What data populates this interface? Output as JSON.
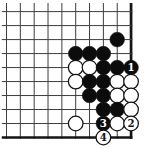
{
  "diagram": {
    "type": "go-problem-diagram",
    "board": {
      "visible_cols": 10,
      "visible_rows": 10,
      "edges": {
        "top": false,
        "left": false,
        "right": true,
        "bottom": true
      },
      "colors": {
        "background": "#ffffff",
        "grid_line": "#3d3d3d",
        "edge_line": "#151515",
        "black_stone": "#0c0c0c",
        "white_stone": "#ffffff",
        "stone_outline": "#151515",
        "label_on_black": "#ffffff",
        "label_on_white": "#151515"
      }
    },
    "stones": [
      {
        "col": 8,
        "row": 2,
        "color": "black",
        "label": ""
      },
      {
        "col": 5,
        "row": 3,
        "color": "black",
        "label": ""
      },
      {
        "col": 6,
        "row": 3,
        "color": "black",
        "label": ""
      },
      {
        "col": 7,
        "row": 3,
        "color": "black",
        "label": ""
      },
      {
        "col": 5,
        "row": 4,
        "color": "white",
        "label": ""
      },
      {
        "col": 6,
        "row": 4,
        "color": "white",
        "label": ""
      },
      {
        "col": 7,
        "row": 4,
        "color": "black",
        "label": ""
      },
      {
        "col": 8,
        "row": 4,
        "color": "black",
        "label": ""
      },
      {
        "col": 9,
        "row": 4,
        "color": "black",
        "label": "1"
      },
      {
        "col": 5,
        "row": 5,
        "color": "white",
        "label": ""
      },
      {
        "col": 6,
        "row": 5,
        "color": "black",
        "label": ""
      },
      {
        "col": 7,
        "row": 5,
        "color": "black",
        "label": ""
      },
      {
        "col": 8,
        "row": 5,
        "color": "white",
        "label": ""
      },
      {
        "col": 9,
        "row": 5,
        "color": "white",
        "label": ""
      },
      {
        "col": 6,
        "row": 6,
        "color": "black",
        "label": ""
      },
      {
        "col": 7,
        "row": 6,
        "color": "black",
        "label": ""
      },
      {
        "col": 8,
        "row": 6,
        "color": "white",
        "label": ""
      },
      {
        "col": 9,
        "row": 6,
        "color": "white",
        "label": ""
      },
      {
        "col": 7,
        "row": 7,
        "color": "black",
        "label": ""
      },
      {
        "col": 8,
        "row": 7,
        "color": "black",
        "label": ""
      },
      {
        "col": 9,
        "row": 7,
        "color": "white",
        "label": ""
      },
      {
        "col": 5,
        "row": 8,
        "color": "white",
        "label": ""
      },
      {
        "col": 7,
        "row": 8,
        "color": "black",
        "label": "3"
      },
      {
        "col": 8,
        "row": 8,
        "color": "white",
        "label": ""
      },
      {
        "col": 9,
        "row": 8,
        "color": "white",
        "label": "2"
      },
      {
        "col": 7,
        "row": 9,
        "color": "white",
        "label": "4"
      }
    ],
    "move_numbers_shown": [
      "1",
      "2",
      "3",
      "4"
    ]
  }
}
